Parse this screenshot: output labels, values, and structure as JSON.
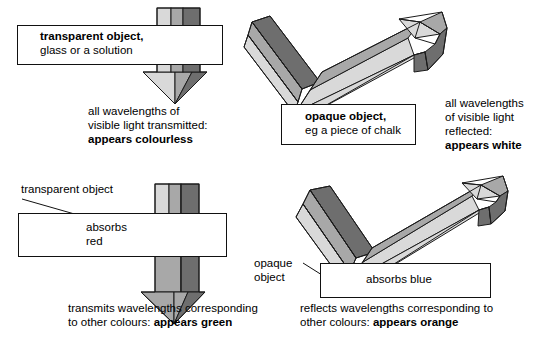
{
  "diagram": {
    "colors": {
      "beam_light": "#d9d9d9",
      "beam_medium": "#a8a8a8",
      "beam_dark": "#6e6e6e",
      "beam_darkest": "#5a5a5a",
      "outline": "#111111",
      "background": "#ffffff"
    }
  },
  "panels": {
    "top_left": {
      "name": "transparent-object-colourless",
      "box_label_line1": "transparent object,",
      "box_label_line2": "glass or a solution",
      "caption_line1": "all wavelengths of",
      "caption_line2": "visible light transmitted:",
      "caption_line3": "appears colourless",
      "beam_in_stripes": [
        "light",
        "medium",
        "dark"
      ],
      "beam_out_stripes": [
        "light",
        "medium",
        "dark"
      ]
    },
    "top_right": {
      "name": "opaque-object-white",
      "box_label_line1": "opaque object,",
      "box_label_line2": "eg a piece of chalk",
      "caption_line1": "all wavelengths",
      "caption_line2": "of visible light",
      "caption_line3": "reflected:",
      "caption_line4": "appears white",
      "beam_in_stripes": [
        "dark",
        "medium",
        "light"
      ],
      "beam_out_stripes": [
        "dark",
        "medium",
        "light"
      ]
    },
    "bottom_left": {
      "name": "transparent-object-green",
      "pointer_label": "transparent object",
      "box_label_line1": "absorbs",
      "box_label_line2": "red",
      "caption_line1": "transmits wavelengths corresponding",
      "caption_line2_plain": "to other colours: ",
      "caption_line2_bold": "appears green",
      "beam_in_stripes": [
        "light",
        "medium",
        "dark"
      ],
      "beam_out_stripes": [
        "medium",
        "dark"
      ]
    },
    "bottom_right": {
      "name": "opaque-object-orange",
      "pointer_label_line1": "opaque",
      "pointer_label_line2": "object",
      "box_label": "absorbs blue",
      "caption_line1": "reflects wavelengths corresponding to",
      "caption_line2_plain": "other colours: ",
      "caption_line2_bold": "appears orange",
      "beam_in_stripes": [
        "dark",
        "medium",
        "light"
      ],
      "beam_out_stripes": [
        "medium",
        "light"
      ]
    }
  }
}
